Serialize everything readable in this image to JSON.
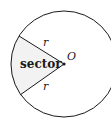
{
  "diagram": {
    "type": "circle-sector",
    "center_label": "O",
    "radius_labels": [
      "r",
      "r"
    ],
    "sector_label": "sector",
    "colors": {
      "stroke": "#1a1a1a",
      "sector_fill": "#f2f2f2",
      "background": "#ffffff"
    }
  }
}
